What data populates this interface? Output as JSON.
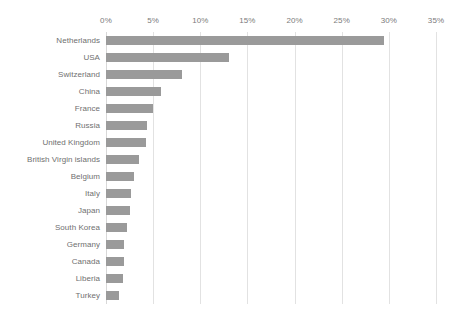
{
  "chart_data": {
    "type": "bar",
    "orientation": "horizontal",
    "title": "",
    "subtitle": "",
    "xlabel": "",
    "ylabel": "",
    "xlim": [
      0,
      35
    ],
    "xtick_labels": [
      "0%",
      "5%",
      "10%",
      "15%",
      "20%",
      "25%",
      "30%",
      "35%"
    ],
    "xticks": [
      0,
      5,
      10,
      15,
      20,
      25,
      30,
      35
    ],
    "grid": true,
    "grid_axis": "x",
    "legend": false,
    "legend_position": "none",
    "units": "percent",
    "bar_color": "#9a9a9a",
    "gridline_color": "#e2e2e2",
    "label_color": "#6f6f6f",
    "categories": [
      "Netherlands",
      "USA",
      "Switzerland",
      "China",
      "France",
      "Russia",
      "United Kingdom",
      "British Virgin islands",
      "Belgium",
      "Italy",
      "Japan",
      "South Korea",
      "Germany",
      "Canada",
      "Liberia",
      "Turkey"
    ],
    "values": [
      29.5,
      13.0,
      8.1,
      5.8,
      5.0,
      4.4,
      4.2,
      3.5,
      3.0,
      2.6,
      2.5,
      2.2,
      1.9,
      1.9,
      1.8,
      1.4
    ]
  }
}
